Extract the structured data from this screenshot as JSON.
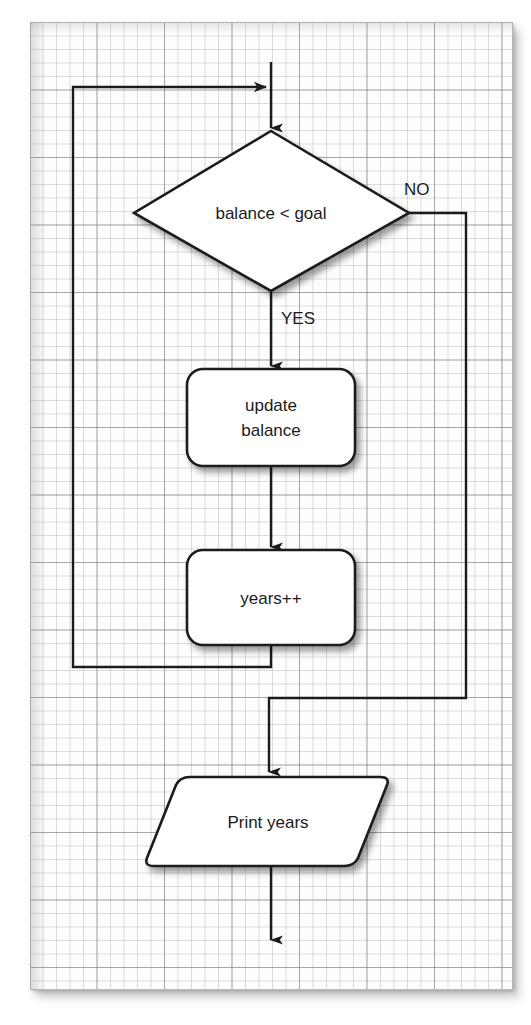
{
  "diagram": {
    "background": "graph-paper",
    "colors": {
      "paper": "#fdfdfd",
      "grid_minor": "#aaacb2",
      "grid_major": "#787880",
      "stroke": "#1b1b1b",
      "shape_fill": "#ffffff",
      "text": "#1b1b1b"
    },
    "nodes": [
      {
        "id": "decision",
        "type": "decision",
        "shape": "diamond",
        "label": "balance < goal",
        "x": 271,
        "y": 212,
        "width": 276,
        "height": 158
      },
      {
        "id": "update-balance",
        "type": "process",
        "shape": "rounded-rectangle",
        "label_line1": "update",
        "label_line2": "balance",
        "x": 271,
        "y": 417,
        "width": 168,
        "height": 97
      },
      {
        "id": "years-increment",
        "type": "process",
        "shape": "rounded-rectangle",
        "label": "years++",
        "x": 271,
        "y": 597,
        "width": 168,
        "height": 95
      },
      {
        "id": "print-years",
        "type": "output",
        "shape": "parallelogram",
        "label": "Print years",
        "x": 271,
        "y": 821,
        "width": 238,
        "height": 89
      }
    ],
    "edges": [
      {
        "id": "entry-to-decision",
        "from": "start",
        "to": "decision",
        "label": ""
      },
      {
        "id": "decision-yes",
        "from": "decision",
        "to": "update-balance",
        "label": "YES"
      },
      {
        "id": "decision-no",
        "from": "decision",
        "to": "print-years",
        "label": "NO"
      },
      {
        "id": "update-to-years",
        "from": "update-balance",
        "to": "years-increment",
        "label": ""
      },
      {
        "id": "loop-back",
        "from": "years-increment",
        "to": "decision",
        "label": ""
      },
      {
        "id": "print-to-exit",
        "from": "print-years",
        "to": "end",
        "label": ""
      }
    ],
    "labels": {
      "decision": "balance < goal",
      "yes": "YES",
      "no": "NO",
      "update_line1": "update",
      "update_line2": "balance",
      "years": "years++",
      "print": "Print years"
    }
  }
}
